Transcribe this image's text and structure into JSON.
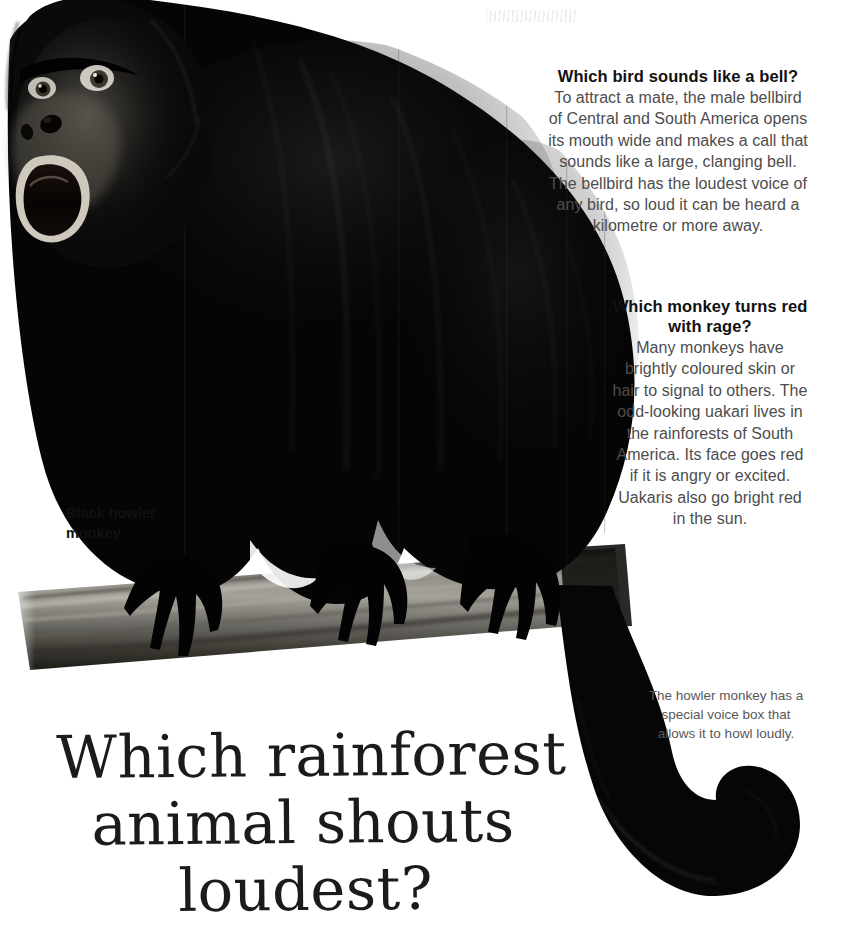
{
  "page": {
    "background_color": "#ffffff",
    "heading_color": "#111111",
    "body_text_color": "#4d4d4d",
    "caption_color": "#58585a",
    "title_color": "#1b1b1b"
  },
  "display_title": {
    "line1": "Which rainforest",
    "line2": "animal shouts",
    "line3": "loudest?"
  },
  "blocks": [
    {
      "id": "bellbird",
      "heading": "Which bird sounds like a bell?",
      "body": "To attract a mate, the male bellbird of Central and South America opens its mouth wide and makes a call that sounds like a large, clanging bell. The bellbird has the loudest voice of any bird, so loud it can be heard a kilometre or more away."
    },
    {
      "id": "uakari",
      "heading": "Which monkey turns red with rage?",
      "body": "Many monkeys have brightly coloured skin or hair to signal to others. The odd-looking uakari lives in the rainforests of South America. Its face goes red if it is angry or excited. Uakaris also go bright red in the sun."
    }
  ],
  "caption": "The howler monkey has a special voice box that allows it to howl loudly.",
  "illustration_label": "Black howler\nmonkey",
  "illustration": {
    "subject": "black-howler-monkey-on-branch",
    "fur_color": "#0a0a0a",
    "branch_color": "#6f6d68",
    "muzzle_highlight": "#d9d4cc"
  }
}
